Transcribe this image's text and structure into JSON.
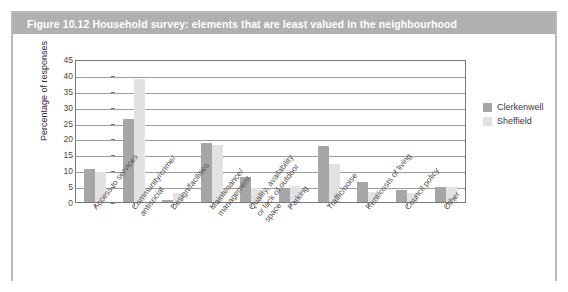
{
  "figure": {
    "title": "Figure 10.12  Household survey: elements that are least valued in the neighbourhood",
    "title_bar_color": "#b0b0b0"
  },
  "legend": {
    "position": "right",
    "items": [
      {
        "label": "Clerkenwell",
        "color": "#a6a6a6"
      },
      {
        "label": "Sheffield",
        "color": "#e2e2e2"
      }
    ]
  },
  "chart_data": {
    "type": "bar",
    "title": "Household survey: elements that are least valued in the neighbourhood",
    "xlabel": "",
    "ylabel": "Percentage of responses",
    "ylim": [
      0,
      45
    ],
    "ytick_step": 5,
    "yticks": [
      "45",
      "40",
      "35",
      "30",
      "25",
      "20",
      "15",
      "10",
      "5",
      "0"
    ],
    "grid": true,
    "legend_position": "right",
    "categories": [
      "Access to services",
      "Community/crime/\nantisocial",
      "Design/facilities",
      "Maintenance/\nmanagement",
      "Quality, availability\nor lack of outdoor\nspace",
      "Parking",
      "Traffic/noise",
      "Rent/costs of living",
      "Council policy",
      "Other"
    ],
    "series": [
      {
        "name": "Clerkenwell",
        "color": "#a6a6a6",
        "values": [
          10.5,
          26.0,
          0.7,
          18.5,
          8.0,
          4.2,
          17.5,
          6.2,
          3.7,
          4.8
        ]
      },
      {
        "name": "Sheffield",
        "color": "#e2e2e2",
        "values": [
          9.4,
          38.8,
          2.7,
          18.0,
          4.5,
          5.0,
          12.0,
          3.0,
          2.7,
          4.8
        ]
      }
    ]
  }
}
